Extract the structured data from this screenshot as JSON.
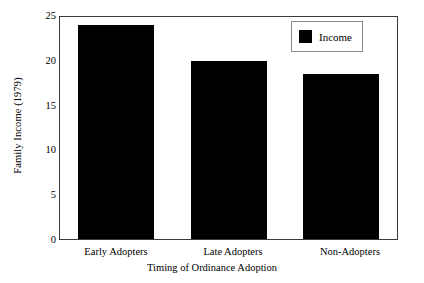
{
  "chart_data": {
    "type": "bar",
    "title": "",
    "categories": [
      "Early Adopters",
      "Late Adopters",
      "Non-Adopters"
    ],
    "values": [
      24.1,
      20.1,
      18.6
    ],
    "series": [
      {
        "name": "Income",
        "values": [
          24.1,
          20.1,
          18.6
        ]
      }
    ],
    "xlabel": "Timing of Ordinance Adoption",
    "ylabel": "Family Income (1979)",
    "ylim": [
      0,
      25
    ],
    "yticks": [
      0,
      5,
      10,
      15,
      20,
      25
    ],
    "ytick_labels": [
      "0",
      "5",
      "10",
      "15",
      "20",
      "25"
    ],
    "grid": false,
    "legend": {
      "position": "top-right",
      "entries": [
        {
          "label": "Income",
          "color": "#000000"
        }
      ]
    },
    "bar_color": "#000000",
    "frame_color": "#3a3a3a",
    "background": "#ffffff"
  }
}
